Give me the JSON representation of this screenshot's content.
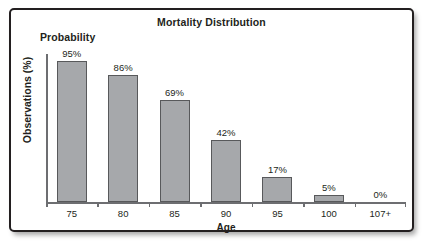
{
  "figure": {
    "title": "Mortality Distribution",
    "series_label": "Probability",
    "frame_border_color": "#231f20",
    "background_color": "#ffffff"
  },
  "chart_data": {
    "type": "bar",
    "title": "Mortality Distribution",
    "xlabel": "Age",
    "ylabel": "Observations (%)",
    "series_name": "Probability",
    "categories": [
      "75",
      "80",
      "85",
      "90",
      "95",
      "100",
      "107+"
    ],
    "values": [
      95,
      86,
      69,
      42,
      17,
      5,
      0
    ],
    "value_labels": [
      "95%",
      "86%",
      "69%",
      "42%",
      "17%",
      "5%",
      "0%"
    ],
    "ylim": [
      0,
      100
    ],
    "grid": false,
    "legend": "none",
    "bar_fill_color": "#a6a8ab",
    "bar_border_color": "#58595b",
    "axis_color": "#6d6e71",
    "text_color": "#231f20"
  }
}
